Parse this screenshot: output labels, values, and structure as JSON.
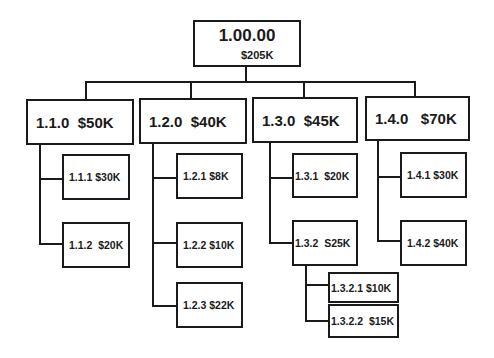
{
  "diagram": {
    "type": "work-breakdown-structure",
    "root": {
      "id": "1.00.00",
      "amount": "$205K"
    },
    "level1": [
      {
        "label": "1.1.0  $50K"
      },
      {
        "label": "1.2.0  $40K"
      },
      {
        "label": "1.3.0  $45K"
      },
      {
        "label": "1.4.0   $70K"
      }
    ],
    "level2": {
      "b1_1": "1.1.1 $30K",
      "b1_2": "1.1.2  $20K",
      "b2_1": "1.2.1 $8K",
      "b2_2": "1.2.2 $10K",
      "b2_3": "1.2.3 $22K",
      "b3_1": "1.3.1  $20K",
      "b3_2": "1.3.2  S25K",
      "b4_1": "1.4.1 $30K",
      "b4_2": "1.4.2 $40K"
    },
    "level3": {
      "b3_2_1": "1.3.2.1 $10K",
      "b3_2_2": "1.3.2.2  $15K"
    }
  }
}
